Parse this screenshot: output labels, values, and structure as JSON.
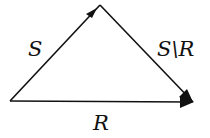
{
  "diagram": {
    "type": "vector-triangle",
    "vertices": {
      "left": [
        10,
        101
      ],
      "top": [
        100,
        5
      ],
      "right": [
        193,
        102
      ]
    },
    "edges": [
      {
        "from": "left",
        "to": "top",
        "label": "S",
        "arrow": "end"
      },
      {
        "from": "top",
        "to": "right",
        "label": "S\\R",
        "arrow": "end"
      },
      {
        "from": "left",
        "to": "right",
        "label": "R",
        "arrow": "end"
      }
    ],
    "labels": {
      "s": "S",
      "s_minus_r": "S\\R",
      "r": "R"
    },
    "colors": {
      "stroke": "#111111",
      "background": "#ffffff"
    }
  }
}
